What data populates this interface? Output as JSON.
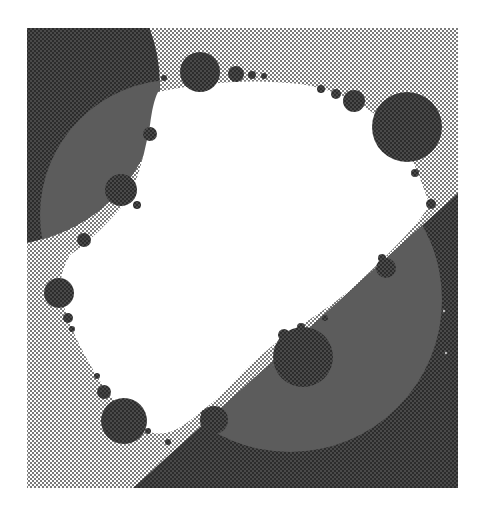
{
  "figure": {
    "canvas": {
      "width": 485,
      "height": 518,
      "background": "#ffffff"
    },
    "frame": {
      "x": 27,
      "y": 28,
      "width": 431,
      "height": 460
    },
    "colors": {
      "stipple_light_bg": "#ffffff",
      "stipple_light_dot": "#6a6a6a",
      "dark_fill": "#3f3f3f",
      "dark_dot": "#2a2a2a",
      "overlay_medium": "#5c5c5c",
      "interior": "#ffffff",
      "circle_fill": "#454545"
    },
    "regions": {
      "top_left_disk": {
        "cx": 0,
        "cy": 85,
        "r": 160
      },
      "lower_right_halfplane": {
        "points": [
          [
            133,
            488
          ],
          [
            458,
            193
          ],
          [
            458,
            488
          ]
        ]
      },
      "overlay_disk_upper": {
        "cx": 175,
        "cy": 215,
        "r": 135
      },
      "overlay_disk_lower": {
        "cx": 290,
        "cy": 300,
        "r": 152
      }
    },
    "boundary_circles": [
      {
        "cx": 200,
        "cy": 72,
        "r": 20
      },
      {
        "cx": 236,
        "cy": 74,
        "r": 8
      },
      {
        "cx": 252,
        "cy": 75,
        "r": 4
      },
      {
        "cx": 264,
        "cy": 76,
        "r": 3
      },
      {
        "cx": 164,
        "cy": 78,
        "r": 3
      },
      {
        "cx": 321,
        "cy": 89,
        "r": 4
      },
      {
        "cx": 336,
        "cy": 94,
        "r": 5
      },
      {
        "cx": 354,
        "cy": 101,
        "r": 11
      },
      {
        "cx": 407,
        "cy": 127,
        "r": 35
      },
      {
        "cx": 415,
        "cy": 173,
        "r": 4
      },
      {
        "cx": 431,
        "cy": 204,
        "r": 5
      },
      {
        "cx": 150,
        "cy": 134,
        "r": 7
      },
      {
        "cx": 121,
        "cy": 190,
        "r": 16
      },
      {
        "cx": 137,
        "cy": 205,
        "r": 4
      },
      {
        "cx": 84,
        "cy": 240,
        "r": 7
      },
      {
        "cx": 59,
        "cy": 293,
        "r": 15
      },
      {
        "cx": 68,
        "cy": 318,
        "r": 5
      },
      {
        "cx": 72,
        "cy": 329,
        "r": 3
      },
      {
        "cx": 97,
        "cy": 376,
        "r": 3
      },
      {
        "cx": 104,
        "cy": 392,
        "r": 7
      },
      {
        "cx": 124,
        "cy": 421,
        "r": 23
      },
      {
        "cx": 148,
        "cy": 431,
        "r": 3
      },
      {
        "cx": 168,
        "cy": 442,
        "r": 3
      },
      {
        "cx": 214,
        "cy": 420,
        "r": 14
      },
      {
        "cx": 205,
        "cy": 414,
        "r": 4
      },
      {
        "cx": 303,
        "cy": 357,
        "r": 30
      },
      {
        "cx": 284,
        "cy": 335,
        "r": 6
      },
      {
        "cx": 301,
        "cy": 327,
        "r": 4
      },
      {
        "cx": 325,
        "cy": 318,
        "r": 3
      },
      {
        "cx": 386,
        "cy": 268,
        "r": 10
      },
      {
        "cx": 382,
        "cy": 258,
        "r": 4
      }
    ],
    "interior_blob_path": "M 158 92 C 200 83, 250 78, 300 84 C 340 90, 380 110, 400 140 C 415 160, 420 180, 430 205 C 410 235, 380 262, 350 290 C 320 315, 290 330, 265 352 C 240 372, 225 395, 200 412 C 185 425, 170 438, 150 432 C 130 420, 112 400, 98 378 C 82 352, 70 328, 62 300 C 58 285, 62 268, 70 255 C 92 240, 110 220, 128 200 C 140 175, 145 150, 150 125 C 152 110, 154 100, 158 92 Z",
    "sparkles": [
      {
        "cx": 444,
        "cy": 311,
        "r": 1.2
      },
      {
        "cx": 446,
        "cy": 353,
        "r": 1.2
      }
    ]
  }
}
